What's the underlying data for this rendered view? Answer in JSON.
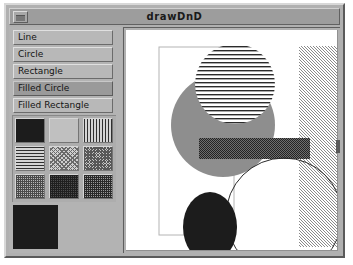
{
  "window": {
    "title": "drawDnD",
    "menu_button_icon": "window-menu-icon"
  },
  "tools": {
    "items": [
      {
        "label": "Line",
        "selected": false
      },
      {
        "label": "Circle",
        "selected": false
      },
      {
        "label": "Rectangle",
        "selected": false
      },
      {
        "label": "Filled Circle",
        "selected": true
      },
      {
        "label": "Filled Rectangle",
        "selected": false
      }
    ],
    "selected_label": "Filled Circle"
  },
  "patterns": {
    "grid": [
      {
        "name": "solid-black",
        "class": "pat-solid-black"
      },
      {
        "name": "empty",
        "class": "pat-empty"
      },
      {
        "name": "vertical-stripes",
        "class": "pat-vstripe"
      },
      {
        "name": "horizontal-stripes",
        "class": "pat-hstripe"
      },
      {
        "name": "diagonal-light",
        "class": "pat-diag-light"
      },
      {
        "name": "diagonal-medium",
        "class": "pat-diag-med"
      },
      {
        "name": "checker-light",
        "class": "pat-check-light"
      },
      {
        "name": "checker-dark",
        "class": "pat-check-dark"
      },
      {
        "name": "checker-medium",
        "class": "pat-check-med"
      }
    ],
    "selected_index": 0,
    "preview_fill": "#1c1c1c"
  },
  "canvas": {
    "background": "#ffffff",
    "shapes": [
      {
        "type": "rectangle-outline",
        "fill": "none",
        "stroke": "#9a9a9a"
      },
      {
        "type": "filled-circle",
        "fill": "#8e8e8e",
        "stroke": "none"
      },
      {
        "type": "striped-circle",
        "fill": "horizontal-stripes",
        "stroke": "none"
      },
      {
        "type": "filled-rectangle",
        "fill": "checker-dark",
        "stroke": "none"
      },
      {
        "type": "filled-rectangle",
        "fill": "diagonal-light",
        "stroke": "none"
      },
      {
        "type": "circle-outline",
        "fill": "none",
        "stroke": "#2a2a2a"
      },
      {
        "type": "filled-circle",
        "fill": "#1c1c1c",
        "stroke": "none"
      }
    ]
  },
  "colors": {
    "window_face": "#b0b0b0",
    "title_bar": "#9d9d9d",
    "button_face": "#b8b8b8",
    "button_selected": "#9a9a9a",
    "canvas_bg": "#ffffff",
    "gray_shape": "#8e8e8e",
    "black_shape": "#1c1c1c"
  }
}
